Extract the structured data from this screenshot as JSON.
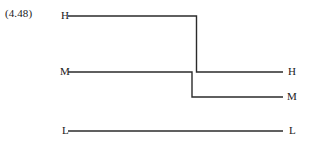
{
  "figure": {
    "equation_number": "(4.48)",
    "background_color": "#ffffff",
    "line_color": "#2b2b2b",
    "line_width": 1.4,
    "labels": {
      "left": [
        {
          "name": "high",
          "text": "H"
        },
        {
          "name": "medium",
          "text": "M"
        },
        {
          "name": "low",
          "text": "L"
        }
      ],
      "right": [
        {
          "name": "high",
          "text": "H"
        },
        {
          "name": "medium",
          "text": "M"
        },
        {
          "name": "low",
          "text": "L"
        }
      ]
    }
  },
  "chart_data": {
    "type": "line",
    "title": "",
    "subtitle": "",
    "xlabel": "",
    "ylabel": "",
    "grid": false,
    "legend_position": "none",
    "annotations": [
      "(4.48)"
    ],
    "y_categories": [
      "L",
      "M",
      "H"
    ],
    "y_pixel_levels": {
      "H": 16,
      "M": 72,
      "L": 131
    },
    "x_range_px": [
      68,
      283
    ],
    "series": [
      {
        "name": "trace-high-to-medium",
        "start_label": "H",
        "end_label": "H",
        "points": [
          {
            "x": 68,
            "level": "H"
          },
          {
            "x": 196.5,
            "level": "H"
          },
          {
            "x": 196.5,
            "level": "M"
          },
          {
            "x": 283,
            "level": "M"
          }
        ]
      },
      {
        "name": "trace-medium-to-low",
        "start_label": "M",
        "end_label": "M",
        "points": [
          {
            "x": 68,
            "level": "M"
          },
          {
            "x": 192,
            "level": "M"
          },
          {
            "x": 192,
            "level": "M_LOW"
          },
          {
            "x": 283,
            "level": "M_LOW"
          }
        ],
        "extra_pixel_levels": {
          "M_LOW": 97
        }
      },
      {
        "name": "trace-low",
        "start_label": "L",
        "end_label": "L",
        "points": [
          {
            "x": 68,
            "level": "L"
          },
          {
            "x": 283,
            "level": "L"
          }
        ]
      }
    ]
  }
}
